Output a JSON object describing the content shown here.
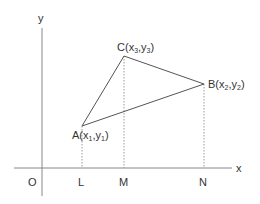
{
  "diagram": {
    "title": "",
    "axes": {
      "x_label": "x",
      "y_label": "y",
      "origin_label": "O"
    },
    "points": {
      "A": {
        "name": "A",
        "coord_x": "x",
        "coord_x_sub": "1",
        "coord_y": "y",
        "coord_y_sub": "1"
      },
      "B": {
        "name": "B",
        "coord_x": "x",
        "coord_x_sub": "2",
        "coord_y": "y",
        "coord_y_sub": "2"
      },
      "C": {
        "name": "C",
        "coord_x": "x",
        "coord_x_sub": "3",
        "coord_y": "y",
        "coord_y_sub": "3"
      }
    },
    "foot_labels": {
      "L": "L",
      "M": "M",
      "N": "N"
    },
    "colors": {
      "axis": "#888888",
      "triangle": "#555555",
      "dotted": "#999999",
      "text": "#333333"
    }
  }
}
